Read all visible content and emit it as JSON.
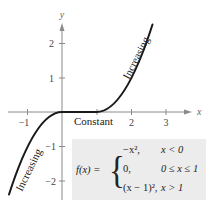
{
  "figure": {
    "type": "piecewise-function-graph",
    "axes": {
      "x_label": "x",
      "y_label": "y",
      "x_ticks": [
        {
          "value": -1,
          "label": "−1"
        },
        {
          "value": 1,
          "label": ""
        },
        {
          "value": 2,
          "label": "2"
        },
        {
          "value": 3,
          "label": "3"
        }
      ],
      "y_ticks": [
        {
          "value": 2,
          "label": "2"
        },
        {
          "value": 1,
          "label": "1"
        },
        {
          "value": -1,
          "label": "−1"
        },
        {
          "value": -2,
          "label": "−2"
        }
      ]
    },
    "annotations": {
      "left": "Increasing",
      "middle": "Constant",
      "right": "Increasing"
    },
    "definition": {
      "lhs": "f(x) =",
      "cases": [
        {
          "expr": "−x²,",
          "cond": "x < 0"
        },
        {
          "expr": "0,",
          "cond": "0 ≤ x ≤ 1"
        },
        {
          "expr": "(x − 1)²,",
          "cond": "x > 1"
        }
      ]
    },
    "colors": {
      "curve": "#1a1a1a",
      "axis": "#8a8a8a",
      "box": "#ececec",
      "text": "#222222"
    }
  }
}
